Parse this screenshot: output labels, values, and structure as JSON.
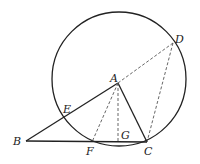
{
  "diagram": {
    "type": "geometry",
    "circle": {
      "cx": 119,
      "cy": 79,
      "r": 67
    },
    "points": {
      "A": {
        "label": "A",
        "x": 118,
        "y": 83
      },
      "B": {
        "label": "B",
        "x": 26,
        "y": 141
      },
      "C": {
        "label": "C",
        "x": 147,
        "y": 142
      },
      "D": {
        "label": "D",
        "x": 173,
        "y": 43
      },
      "E": {
        "label": "E",
        "x": 63,
        "y": 117
      },
      "F": {
        "label": "F",
        "x": 92,
        "y": 142
      },
      "G": {
        "label": "G",
        "x": 118,
        "y": 142
      }
    },
    "solid_segments": [
      "BA",
      "AC",
      "BC"
    ],
    "dashed_segments": [
      "AD",
      "AF",
      "AG",
      "DC"
    ]
  }
}
